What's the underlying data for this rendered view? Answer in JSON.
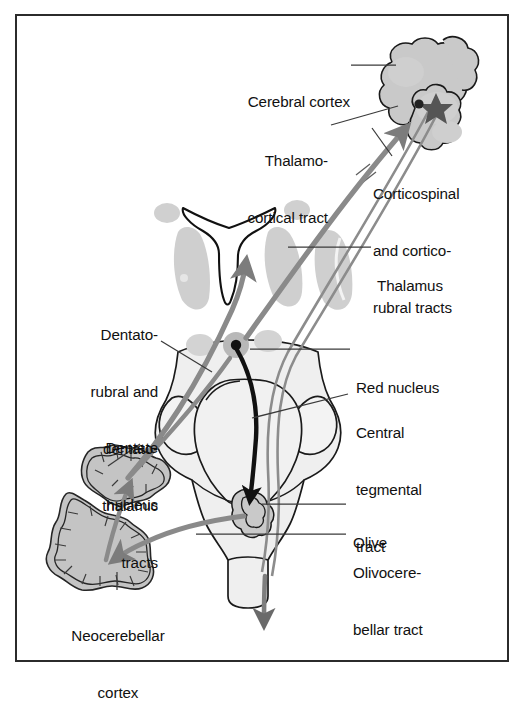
{
  "figure": {
    "border_color": "#2b2b2b",
    "background": "#ffffff"
  },
  "palette": {
    "tract_gray": "#8a8a8a",
    "tract_dark": "#6f6f6f",
    "tract_black": "#111111",
    "nuclei_fill": "#c9c9c9",
    "brainstem_fill": "#ededed",
    "cerebellum_fill": "#c4c4c4",
    "outline": "#1a1a1a",
    "leader_line": "#3a3a3a",
    "text": "#111111"
  },
  "labels": [
    {
      "id": "cerebral-cortex",
      "text": "Cerebral cortex",
      "lines": [
        "Cerebral cortex"
      ]
    },
    {
      "id": "thalamocortical-tract",
      "text": "Thalamo-cortical tract",
      "lines": [
        "Thalamo-",
        "cortical tract"
      ]
    },
    {
      "id": "corticospinal-tracts",
      "text": "Corticospinal and cortico-rubral tracts",
      "lines": [
        "Corticospinal",
        "and cortico-",
        "rubral tracts"
      ]
    },
    {
      "id": "thalamus",
      "text": "Thalamus",
      "lines": [
        "Thalamus"
      ]
    },
    {
      "id": "red-nucleus",
      "text": "Red nucleus",
      "lines": [
        "Red nucleus"
      ]
    },
    {
      "id": "central-tegmental-tract",
      "text": "Central tegmental tract",
      "lines": [
        "Central",
        "tegmental",
        "tract"
      ]
    },
    {
      "id": "olive",
      "text": "Olive",
      "lines": [
        "Olive"
      ]
    },
    {
      "id": "olivocerebellar-tract",
      "text": "Olivocerebellar tract",
      "lines": [
        "Olivocere-",
        "bellar tract"
      ]
    },
    {
      "id": "dentatorubral-tracts",
      "text": "Dentato-rubral and dentato-thalamic tracts",
      "lines": [
        "Dentato-",
        "rubral and",
        "dentato-",
        "thalamic",
        "tracts"
      ]
    },
    {
      "id": "dentate-nucleus",
      "text": "Dentate nucleus",
      "lines": [
        "Dentate",
        "nucleus"
      ]
    },
    {
      "id": "neocerebellar-cortex",
      "text": "Neocerebellar cortex",
      "lines": [
        "Neocerebellar",
        "cortex"
      ]
    }
  ],
  "text": {
    "cerebral_cortex": "Cerebral cortex",
    "thalamo_1": "Thalamo-",
    "thalamo_2": "cortical tract",
    "cortico_1": "Corticospinal",
    "cortico_2": "and cortico-",
    "cortico_3": "rubral tracts",
    "thalamus": "Thalamus",
    "red_nucleus": "Red nucleus",
    "central_1": "Central",
    "central_2": "tegmental",
    "central_3": "tract",
    "olive": "Olive",
    "olivocereb_1": "Olivocere-",
    "olivocereb_2": "bellar tract",
    "dentato_1": "Dentato-",
    "dentato_2": "rubral and",
    "dentato_3": "dentato-",
    "dentato_4": "thalamic",
    "dentato_5": "tracts",
    "dentate_1": "Dentate",
    "dentate_2": "nucleus",
    "neocereb_1": "Neocerebellar",
    "neocereb_2": "cortex"
  }
}
